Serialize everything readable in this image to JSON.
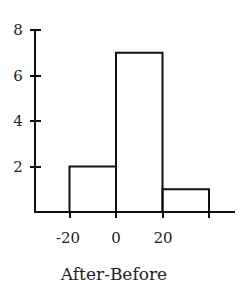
{
  "chart_data": {
    "type": "bar",
    "subtype": "histogram",
    "title": "",
    "xlabel": "After-Before",
    "ylabel": "",
    "bins": [
      {
        "from": -20,
        "to": 0,
        "count": 2
      },
      {
        "from": 0,
        "to": 20,
        "count": 7
      },
      {
        "from": 20,
        "to": 40,
        "count": 1
      }
    ],
    "categories": [
      "-20 to 0",
      "0 to 20",
      "20 to 40"
    ],
    "values": [
      2,
      7,
      1
    ],
    "x_ticks": [
      "-20",
      "0",
      "20"
    ],
    "y_ticks": [
      "2",
      "4",
      "6",
      "8"
    ],
    "ylim": [
      0,
      8
    ],
    "grid": false,
    "legend": null
  },
  "labels": {
    "xlabel": "After-Before",
    "y_tick_2": "2",
    "y_tick_4": "4",
    "y_tick_6": "6",
    "y_tick_8": "8",
    "x_tick_m20": "-20",
    "x_tick_0": "0",
    "x_tick_20": "20"
  }
}
